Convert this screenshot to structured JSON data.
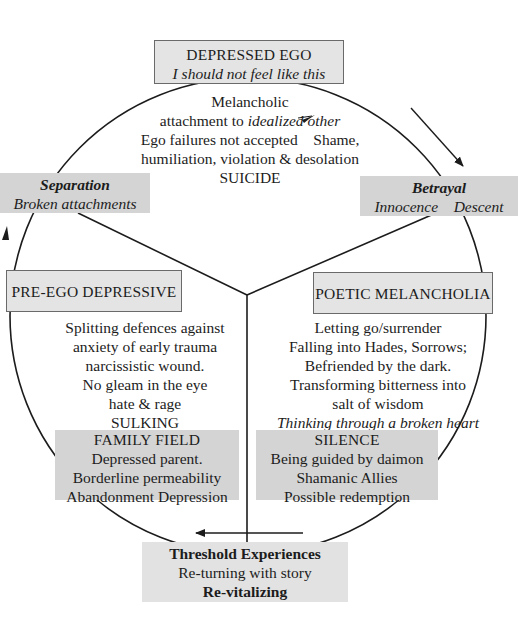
{
  "diagram": {
    "top_box": {
      "title": "DEPRESSED EGO",
      "subtitle": "I should not feel like this"
    },
    "top_sector": {
      "lines": [
        {
          "text": "Melancholic",
          "parts": [
            {
              "t": "Melancholic",
              "style": "normal"
            }
          ]
        },
        {
          "parts": [
            {
              "t": "attachment to ",
              "style": "normal"
            },
            {
              "t": "idealized other",
              "style": "italic"
            }
          ]
        },
        {
          "parts": [
            {
              "t": "Ego failures not accepted",
              "style": "normal"
            },
            {
              "t": "    Shame,",
              "style": "normal"
            }
          ]
        },
        {
          "parts": [
            {
              "t": "humiliation, violation & desolation",
              "style": "normal"
            }
          ]
        },
        {
          "parts": [
            {
              "t": "SUICIDE",
              "style": "normal"
            }
          ]
        }
      ],
      "line1": "Melancholic",
      "line2_plain": "attachment to ",
      "line2_italic": "idealized other",
      "line3_left": "Ego failures not accepted",
      "line3_right": "Shame,",
      "line4": "humiliation, violation & desolation",
      "line5": "SUICIDE"
    },
    "separation_box": {
      "title": "Separation",
      "subtitle": "Broken attachments"
    },
    "betrayal_box": {
      "title": "Betrayal",
      "left": "Innocence",
      "right": "Descent"
    },
    "pre_ego_box": {
      "title": "PRE-EGO DEPRESSIVE"
    },
    "pre_ego_sector": {
      "lines": [
        "Splitting defences against",
        "anxiety of early trauma",
        "narcissistic wound.",
        "No gleam in the eye",
        "hate & rage",
        "SULKING"
      ]
    },
    "poetic_box": {
      "title": "POETIC MELANCHOLIA"
    },
    "poetic_sector": {
      "lines": [
        "Letting go/surrender",
        "Falling into Hades, Sorrows;",
        "Befriended by the dark.",
        "Transforming bitterness into",
        "salt of wisdom"
      ],
      "italic_line": "Thinking through a broken heart"
    },
    "family_box": {
      "title": "FAMILY FIELD",
      "lines": [
        "Depressed parent.",
        "Borderline permeability",
        "Abandonment Depression"
      ]
    },
    "silence_box": {
      "title": "SILENCE",
      "lines": [
        "Being guided by daimon",
        "Shamanic Allies",
        "Possible redemption"
      ]
    },
    "threshold_box": {
      "title": "Threshold Experiences",
      "line2": "Re-turning with story",
      "line3": "Re-vitalizing"
    },
    "colors": {
      "outlined_box_fill": "#e4e4e4",
      "filled_box_fill": "#d4d4d4",
      "stroke": "#1c1c1c"
    },
    "arrows": [
      {
        "name": "clockwise-arrow-top-right",
        "direction": "down-right"
      },
      {
        "name": "arrow-left-side",
        "direction": "up"
      },
      {
        "name": "arrow-bottom",
        "direction": "left"
      },
      {
        "name": "arrow-idealized-to-shame",
        "direction": "right"
      },
      {
        "name": "arrow-innocence-to-descent",
        "direction": "right"
      }
    ]
  }
}
